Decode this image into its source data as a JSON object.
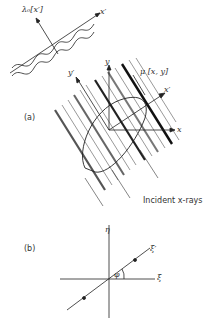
{
  "figure": {
    "top_diagram": {
      "wave_label": "λ₀[x′]",
      "x_prime_label": "x′"
    },
    "panel_a": {
      "panel_label": "(a)",
      "y_label": "y",
      "y_prime_label": "y′",
      "x_label": "x",
      "x_prime_label": "x′",
      "mu_label": "μ [x, y]",
      "rays_label": "Incident x-rays"
    },
    "panel_b": {
      "panel_label": "(b)",
      "eta_label": "η",
      "xi_label": "ξ",
      "xi_prime_label": "ξ′",
      "phi_label": "φ"
    }
  }
}
